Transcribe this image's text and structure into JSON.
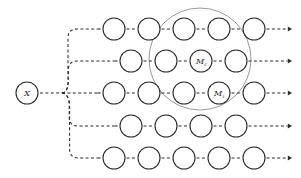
{
  "diagram": {
    "canvas": {
      "width": 301,
      "height": 178,
      "background": "#ffffff"
    },
    "colors": {
      "node_stroke": "#2b2b2b",
      "node_fill": "#ffffff",
      "link": "#2b2b2b",
      "cluster_outline": "#9a9a9a",
      "label": "#1a1a1a"
    },
    "root": {
      "label": "X",
      "label_main": "X",
      "label_sub": "",
      "cx": 27,
      "cy": 93,
      "r": 11
    },
    "cluster": {
      "name": "highlight-ellipse",
      "cx": 200,
      "cy": 59,
      "rx": 51,
      "ry": 51
    },
    "branch_fan": {
      "origin_x": 38,
      "origin_y": 93,
      "junction_x": 62,
      "junction_y": 93
    },
    "node_radius": 11,
    "rows": [
      {
        "name": "row-1",
        "y": 29,
        "start_x": 114,
        "spacing": 35,
        "nodes": [
          {
            "label_main": "",
            "label_sub": ""
          },
          {
            "label_main": "",
            "label_sub": ""
          },
          {
            "label_main": "",
            "label_sub": ""
          },
          {
            "label_main": "",
            "label_sub": ""
          },
          {
            "label_main": "",
            "label_sub": ""
          }
        ]
      },
      {
        "name": "row-2",
        "y": 61,
        "start_x": 131,
        "spacing": 35,
        "nodes": [
          {
            "label_main": "",
            "label_sub": ""
          },
          {
            "label_main": "",
            "label_sub": ""
          },
          {
            "label_main": "M",
            "label_sub": "c"
          },
          {
            "label_main": "",
            "label_sub": ""
          }
        ]
      },
      {
        "name": "row-3",
        "y": 93,
        "start_x": 114,
        "spacing": 35,
        "nodes": [
          {
            "label_main": "",
            "label_sub": ""
          },
          {
            "label_main": "",
            "label_sub": ""
          },
          {
            "label_main": "",
            "label_sub": ""
          },
          {
            "label_main": "M",
            "label_sub": "i"
          },
          {
            "label_main": "",
            "label_sub": ""
          }
        ]
      },
      {
        "name": "row-4",
        "y": 126,
        "start_x": 131,
        "spacing": 35,
        "nodes": [
          {
            "label_main": "",
            "label_sub": ""
          },
          {
            "label_main": "",
            "label_sub": ""
          },
          {
            "label_main": "",
            "label_sub": ""
          },
          {
            "label_main": "",
            "label_sub": ""
          }
        ]
      },
      {
        "name": "row-5",
        "y": 158,
        "start_x": 114,
        "spacing": 35,
        "nodes": [
          {
            "label_main": "",
            "label_sub": ""
          },
          {
            "label_main": "",
            "label_sub": ""
          },
          {
            "label_main": "",
            "label_sub": ""
          },
          {
            "label_main": "",
            "label_sub": ""
          },
          {
            "label_main": "",
            "label_sub": ""
          }
        ]
      }
    ],
    "arrow_end_x": 292
  }
}
